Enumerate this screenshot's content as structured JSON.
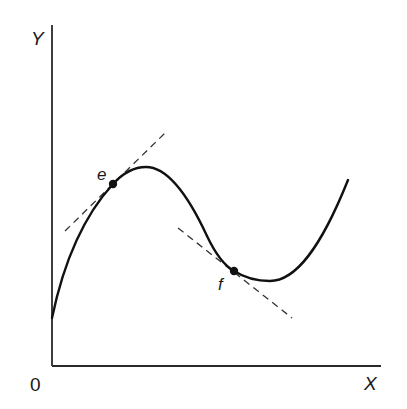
{
  "diagram": {
    "type": "function-curve-with-tangents",
    "axes": {
      "y_label": "Y",
      "x_label": "X",
      "origin_label": "0"
    },
    "curve": {
      "description": "Cubic-like curve: rises from the Y-axis to a local maximum, falls to a local minimum, then rises again",
      "color": "#111111"
    },
    "points": [
      {
        "id": "e",
        "label": "e",
        "location": "on rising segment just before local maximum",
        "tangent_slope_sign": "positive"
      },
      {
        "id": "f",
        "label": "f",
        "location": "on falling segment just before local minimum",
        "tangent_slope_sign": "negative"
      }
    ],
    "tangent_style": "dashed",
    "colors": {
      "ink": "#111111",
      "background": "#ffffff"
    }
  }
}
